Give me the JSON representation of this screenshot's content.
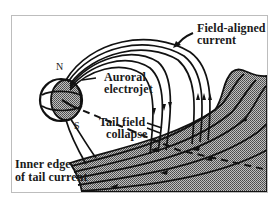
{
  "figure": {
    "type": "magnetosphere-substorm-current-wedge",
    "labels": {
      "north_pole": "N",
      "south_pole": "S",
      "field_aligned_current_line1": "Field-aligned",
      "field_aligned_current_line2": "current",
      "auroral_electrojet_line1": "Auroral",
      "auroral_electrojet_line2": "electrojet",
      "tail_field_collapse_line1": "Tail field",
      "tail_field_collapse_line2": "collapse",
      "inner_edge_line1": "Inner edge",
      "inner_edge_line2": "of tail current"
    },
    "colors": {
      "ink": "#111111",
      "earth_fill": "#9a9a9a",
      "tail_fill": "#8c8c8c",
      "frame_border": "#bdbdbd",
      "background": "#ffffff"
    }
  }
}
